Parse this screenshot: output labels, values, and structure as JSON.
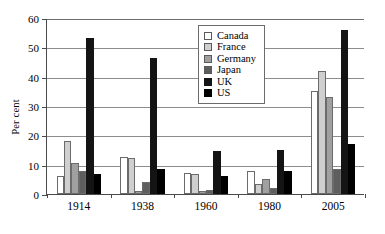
{
  "chart_data": {
    "type": "bar",
    "title": "",
    "subtitle": "",
    "xlabel": "",
    "ylabel": "Per cent",
    "categories": [
      "1914",
      "1938",
      "1960",
      "1980",
      "2005"
    ],
    "ylim": [
      0,
      60
    ],
    "yticks": [
      0,
      10,
      20,
      30,
      40,
      50,
      60
    ],
    "ytick_labels": [
      "0",
      "10",
      "20",
      "30",
      "40",
      "50",
      "60"
    ],
    "grid": true,
    "grid_axis": "y",
    "legend_position": "upper-center-right",
    "series": [
      {
        "name": "Canada",
        "color": "#ffffff",
        "values": [
          6.0,
          12.5,
          7.0,
          8.0,
          35.0
        ]
      },
      {
        "name": "France",
        "color": "#cfcfcf",
        "values": [
          18.2,
          12.4,
          6.9,
          3.5,
          42.0
        ]
      },
      {
        "name": "Germany",
        "color": "#a0a0a0",
        "values": [
          10.6,
          1.0,
          1.0,
          5.0,
          33.2
        ]
      },
      {
        "name": "Japan",
        "color": "#5e5e5e",
        "values": [
          8.0,
          4.0,
          1.2,
          2.0,
          8.6
        ]
      },
      {
        "name": "UK",
        "color": "#141414",
        "values": [
          53.2,
          46.2,
          14.8,
          15.0,
          55.8
        ]
      },
      {
        "name": "US",
        "color": "#000000",
        "values": [
          6.8,
          8.5,
          6.3,
          7.8,
          17.0
        ]
      }
    ]
  },
  "legend": {
    "items": [
      {
        "label": "Canada",
        "color": "#ffffff"
      },
      {
        "label": "France",
        "color": "#cfcfcf"
      },
      {
        "label": "Germany",
        "color": "#a0a0a0"
      },
      {
        "label": "Japan",
        "color": "#5e5e5e"
      },
      {
        "label": "UK",
        "color": "#141414"
      },
      {
        "label": "US",
        "color": "#000000"
      }
    ]
  }
}
